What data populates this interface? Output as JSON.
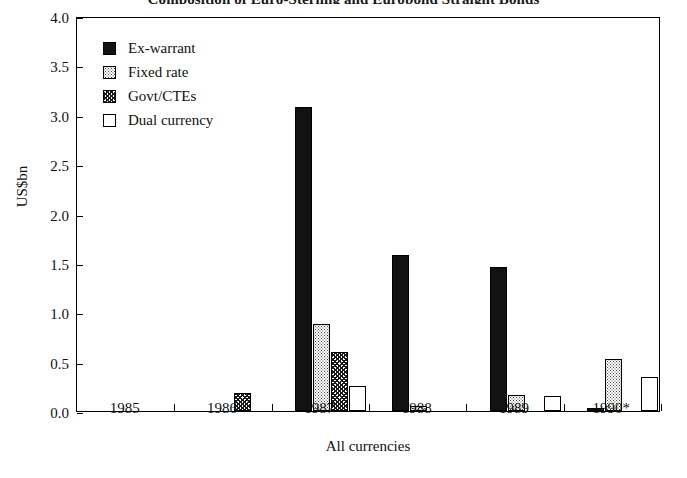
{
  "chart_data": {
    "type": "bar",
    "title": "Composition of Euro-Sterling and Eurobond Straight Bonds",
    "xlabel": "All currencies",
    "ylabel": "US$bn",
    "categories": [
      "1985",
      "1986",
      "1987",
      "1988",
      "1989",
      "1990*"
    ],
    "yticks": [
      "0.0",
      "0.5",
      "1.0",
      "1.5",
      "2.0",
      "2.5",
      "3.0",
      "3.5",
      "4.0"
    ],
    "ylim": [
      0,
      4.0
    ],
    "grid": false,
    "legend_position": "top-left-inside",
    "series": [
      {
        "name": "Ex-warrant",
        "fill": "solid-black",
        "values": [
          0,
          0,
          3.08,
          1.58,
          1.46,
          0.03
        ]
      },
      {
        "name": "Fixed rate",
        "fill": "light-dotted",
        "values": [
          0,
          0,
          0.88,
          0.05,
          0.16,
          0.53
        ]
      },
      {
        "name": "Govt/CTEs",
        "fill": "cross-hatched",
        "values": [
          0,
          0.18,
          0.6,
          0,
          0,
          0.0
        ]
      },
      {
        "name": "Dual currency",
        "fill": "white-outline",
        "values": [
          0,
          0,
          0.25,
          0,
          0.15,
          0.34
        ]
      }
    ]
  },
  "axes": {
    "y_caption": "US$bn",
    "x_caption": "All currencies"
  },
  "legend": {
    "items": [
      {
        "label": "Ex-warrant",
        "swatch": "solid-black-swatch"
      },
      {
        "label": "Fixed rate",
        "swatch": "dotted-swatch"
      },
      {
        "label": "Govt/CTEs",
        "swatch": "hatched-swatch"
      },
      {
        "label": "Dual currency",
        "swatch": "outline-swatch"
      }
    ]
  },
  "colors": {
    "ex_warrant": "#121212",
    "fixed_rate": "#ffffff",
    "govt_ctes": "#ffffff",
    "dual_currency": "#ffffff",
    "axis": "#000000",
    "background": "#ffffff"
  }
}
